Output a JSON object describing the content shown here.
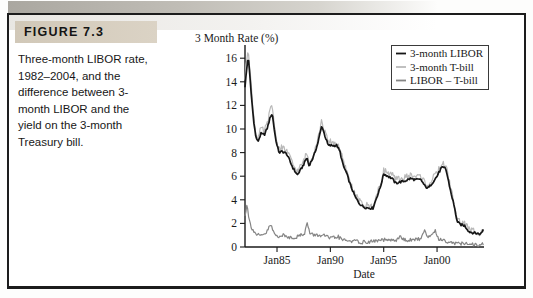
{
  "figure": {
    "label": "FIGURE 7.3",
    "caption": "Three-month LIBOR rate, 1982–2004, and the difference between 3-month LIBOR and the yield on the 3-month Treasury bill."
  },
  "colors": {
    "band": "#d3cabb",
    "border": "#1c1c1c",
    "libor_line": "#161616",
    "tbill_line": "#b9b9b9",
    "spread_line": "#858585"
  },
  "chart_data": {
    "type": "line",
    "title": "3 Month Rate (%)",
    "xlabel": "Date",
    "x_range": [
      1982,
      2004.4
    ],
    "y_range": [
      0,
      17
    ],
    "y_ticks": [
      0,
      2,
      4,
      6,
      8,
      10,
      12,
      14,
      16
    ],
    "x_ticks": [
      {
        "label": "Jan85",
        "year": 1985
      },
      {
        "label": "Jan90",
        "year": 1990
      },
      {
        "label": "Jan95",
        "year": 1995
      },
      {
        "label": "Jan00",
        "year": 2000
      }
    ],
    "grid": false,
    "legend_position": "top-right",
    "series": [
      {
        "name": "3-month LIBOR",
        "color": "#161616",
        "points": [
          [
            1982.0,
            13.6
          ],
          [
            1982.15,
            15.0
          ],
          [
            1982.3,
            16.2
          ],
          [
            1982.45,
            14.6
          ],
          [
            1982.6,
            12.8
          ],
          [
            1982.8,
            10.8
          ],
          [
            1983.0,
            9.4
          ],
          [
            1983.2,
            8.9
          ],
          [
            1983.5,
            9.6
          ],
          [
            1983.8,
            9.5
          ],
          [
            1984.1,
            10.1
          ],
          [
            1984.4,
            11.1
          ],
          [
            1984.55,
            11.3
          ],
          [
            1984.8,
            9.6
          ],
          [
            1985.0,
            8.6
          ],
          [
            1985.2,
            8.0
          ],
          [
            1985.5,
            8.1
          ],
          [
            1985.9,
            7.9
          ],
          [
            1986.2,
            7.3
          ],
          [
            1986.5,
            6.7
          ],
          [
            1986.9,
            6.1
          ],
          [
            1987.2,
            6.5
          ],
          [
            1987.5,
            7.0
          ],
          [
            1987.8,
            7.6
          ],
          [
            1988.0,
            6.9
          ],
          [
            1988.4,
            7.6
          ],
          [
            1988.8,
            8.7
          ],
          [
            1989.2,
            10.3
          ],
          [
            1989.5,
            9.4
          ],
          [
            1989.8,
            8.6
          ],
          [
            1990.2,
            8.6
          ],
          [
            1990.6,
            8.6
          ],
          [
            1990.9,
            8.1
          ],
          [
            1991.2,
            6.9
          ],
          [
            1991.5,
            6.3
          ],
          [
            1991.9,
            5.2
          ],
          [
            1992.3,
            4.3
          ],
          [
            1992.7,
            3.7
          ],
          [
            1993.1,
            3.4
          ],
          [
            1993.6,
            3.3
          ],
          [
            1994.0,
            3.3
          ],
          [
            1994.3,
            4.1
          ],
          [
            1994.7,
            5.1
          ],
          [
            1995.0,
            6.2
          ],
          [
            1995.4,
            6.0
          ],
          [
            1995.8,
            5.8
          ],
          [
            1996.1,
            5.4
          ],
          [
            1996.5,
            5.5
          ],
          [
            1997.0,
            5.6
          ],
          [
            1997.5,
            5.8
          ],
          [
            1998.0,
            5.7
          ],
          [
            1998.5,
            5.7
          ],
          [
            1998.9,
            5.1
          ],
          [
            1999.2,
            5.0
          ],
          [
            1999.6,
            5.5
          ],
          [
            2000.0,
            6.0
          ],
          [
            2000.4,
            6.7
          ],
          [
            2000.8,
            6.7
          ],
          [
            2001.0,
            5.9
          ],
          [
            2001.3,
            4.6
          ],
          [
            2001.6,
            3.5
          ],
          [
            2001.9,
            2.1
          ],
          [
            2002.2,
            1.9
          ],
          [
            2002.6,
            1.8
          ],
          [
            2003.0,
            1.3
          ],
          [
            2003.4,
            1.2
          ],
          [
            2003.8,
            1.15
          ],
          [
            2004.1,
            1.1
          ],
          [
            2004.4,
            1.6
          ]
        ]
      },
      {
        "name": "3-month T-bill",
        "color": "#b9b9b9",
        "points": [
          [
            1982.0,
            14.2
          ],
          [
            1982.15,
            15.8
          ],
          [
            1982.3,
            16.9
          ],
          [
            1982.45,
            15.2
          ],
          [
            1982.6,
            13.3
          ],
          [
            1982.8,
            11.2
          ],
          [
            1983.0,
            9.6
          ],
          [
            1983.2,
            9.1
          ],
          [
            1983.5,
            9.9
          ],
          [
            1983.8,
            9.7
          ],
          [
            1984.1,
            10.4
          ],
          [
            1984.4,
            11.6
          ],
          [
            1984.55,
            11.9
          ],
          [
            1984.8,
            9.9
          ],
          [
            1985.0,
            8.8
          ],
          [
            1985.2,
            8.2
          ],
          [
            1985.5,
            8.3
          ],
          [
            1985.9,
            8.1
          ],
          [
            1986.2,
            7.5
          ],
          [
            1986.5,
            6.9
          ],
          [
            1986.9,
            6.3
          ],
          [
            1987.2,
            6.7
          ],
          [
            1987.5,
            7.2
          ],
          [
            1987.8,
            7.9
          ],
          [
            1988.0,
            7.1
          ],
          [
            1988.4,
            7.8
          ],
          [
            1988.8,
            9.0
          ],
          [
            1989.2,
            10.6
          ],
          [
            1989.5,
            9.6
          ],
          [
            1989.8,
            8.8
          ],
          [
            1990.2,
            8.8
          ],
          [
            1990.6,
            8.7
          ],
          [
            1990.9,
            8.3
          ],
          [
            1991.2,
            7.1
          ],
          [
            1991.5,
            6.4
          ],
          [
            1991.9,
            5.3
          ],
          [
            1992.3,
            4.4
          ],
          [
            1992.7,
            3.8
          ],
          [
            1993.1,
            3.5
          ],
          [
            1993.6,
            3.4
          ],
          [
            1994.0,
            3.4
          ],
          [
            1994.3,
            4.2
          ],
          [
            1994.7,
            5.2
          ],
          [
            1995.0,
            6.4
          ],
          [
            1995.4,
            6.2
          ],
          [
            1995.8,
            6.0
          ],
          [
            1996.1,
            5.6
          ],
          [
            1996.5,
            5.7
          ],
          [
            1997.0,
            5.8
          ],
          [
            1997.5,
            6.0
          ],
          [
            1998.0,
            5.9
          ],
          [
            1998.5,
            5.9
          ],
          [
            1998.9,
            5.3
          ],
          [
            1999.2,
            5.2
          ],
          [
            1999.6,
            5.7
          ],
          [
            2000.0,
            6.2
          ],
          [
            2000.4,
            6.9
          ],
          [
            2000.8,
            6.9
          ],
          [
            2001.0,
            6.1
          ],
          [
            2001.3,
            4.8
          ],
          [
            2001.6,
            3.6
          ],
          [
            2001.9,
            2.2
          ],
          [
            2002.2,
            2.0
          ],
          [
            2002.6,
            1.9
          ],
          [
            2003.0,
            1.4
          ],
          [
            2003.4,
            1.3
          ],
          [
            2003.8,
            1.2
          ],
          [
            2004.1,
            1.15
          ],
          [
            2004.4,
            1.7
          ]
        ]
      },
      {
        "name": "LIBOR – T-bill",
        "color": "#858585",
        "points": [
          [
            1982.0,
            2.6
          ],
          [
            1982.2,
            3.8
          ],
          [
            1982.35,
            2.4
          ],
          [
            1982.6,
            1.7
          ],
          [
            1983.0,
            1.1
          ],
          [
            1983.5,
            0.9
          ],
          [
            1984.0,
            1.2
          ],
          [
            1984.4,
            1.9
          ],
          [
            1984.7,
            1.2
          ],
          [
            1985.0,
            0.9
          ],
          [
            1985.5,
            1.0
          ],
          [
            1986.0,
            0.85
          ],
          [
            1986.5,
            0.8
          ],
          [
            1987.0,
            0.9
          ],
          [
            1987.6,
            1.2
          ],
          [
            1987.8,
            2.1
          ],
          [
            1988.1,
            1.1
          ],
          [
            1988.6,
            1.0
          ],
          [
            1989.1,
            1.0
          ],
          [
            1989.6,
            0.9
          ],
          [
            1990.1,
            0.7
          ],
          [
            1990.7,
            0.9
          ],
          [
            1991.1,
            0.6
          ],
          [
            1991.6,
            0.55
          ],
          [
            1992.2,
            0.5
          ],
          [
            1993.0,
            0.4
          ],
          [
            1993.8,
            0.45
          ],
          [
            1994.5,
            0.55
          ],
          [
            1995.2,
            0.6
          ],
          [
            1996.0,
            0.5
          ],
          [
            1996.5,
            0.85
          ],
          [
            1997.1,
            0.55
          ],
          [
            1997.8,
            0.6
          ],
          [
            1998.4,
            0.7
          ],
          [
            1998.85,
            1.35
          ],
          [
            1999.2,
            0.8
          ],
          [
            1999.8,
            1.4
          ],
          [
            2000.2,
            0.65
          ],
          [
            2000.7,
            0.55
          ],
          [
            2001.1,
            0.45
          ],
          [
            2001.6,
            0.35
          ],
          [
            2002.1,
            0.3
          ],
          [
            2002.8,
            0.25
          ],
          [
            2003.4,
            0.2
          ],
          [
            2004.0,
            0.18
          ],
          [
            2004.4,
            0.25
          ]
        ]
      }
    ]
  }
}
